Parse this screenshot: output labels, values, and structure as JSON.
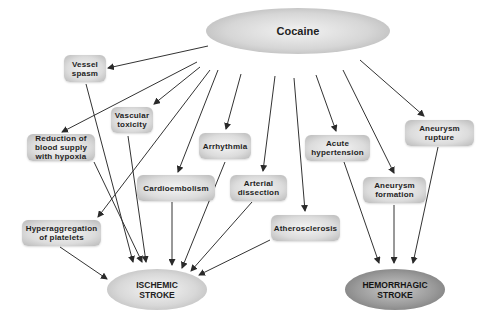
{
  "diagram": {
    "source_node": {
      "id": "cocaine",
      "label": "Cocaine"
    },
    "mechanisms": [
      {
        "id": "vessel-spasm",
        "label": "Vessel\nspasm"
      },
      {
        "id": "vascular-toxicity",
        "label": "Vascular\ntoxicity"
      },
      {
        "id": "reduction-blood-supply",
        "label": "Reduction of\nblood supply\nwith hypoxia"
      },
      {
        "id": "arrhythmia",
        "label": "Arrhythmia"
      },
      {
        "id": "cardioembolism",
        "label": "Cardioembolism"
      },
      {
        "id": "arterial-dissection",
        "label": "Arterial\ndissection"
      },
      {
        "id": "atherosclerosis",
        "label": "Atherosclerosis"
      },
      {
        "id": "hyperaggregation",
        "label": "Hyperaggregation\nof platelets"
      },
      {
        "id": "acute-hypertension",
        "label": "Acute\nhypertension"
      },
      {
        "id": "aneurysm-formation",
        "label": "Aneurysm\nformation"
      },
      {
        "id": "aneurysm-rupture",
        "label": "Aneurysm\nrupture"
      }
    ],
    "outcomes": [
      {
        "id": "ischemic-stroke",
        "label": "ISCHEMIC\nSTROKE"
      },
      {
        "id": "hemorrhagic-stroke",
        "label": "HEMORRHAGIC\nSTROKE"
      }
    ],
    "edges": [
      [
        "cocaine",
        "vessel-spasm"
      ],
      [
        "cocaine",
        "vascular-toxicity"
      ],
      [
        "cocaine",
        "reduction-blood-supply"
      ],
      [
        "cocaine",
        "hyperaggregation"
      ],
      [
        "cocaine",
        "cardioembolism"
      ],
      [
        "cocaine",
        "arrhythmia"
      ],
      [
        "cocaine",
        "arterial-dissection"
      ],
      [
        "cocaine",
        "atherosclerosis"
      ],
      [
        "cocaine",
        "acute-hypertension"
      ],
      [
        "cocaine",
        "aneurysm-formation"
      ],
      [
        "cocaine",
        "aneurysm-rupture"
      ],
      [
        "vessel-spasm",
        "ischemic-stroke"
      ],
      [
        "vascular-toxicity",
        "ischemic-stroke"
      ],
      [
        "reduction-blood-supply",
        "ischemic-stroke"
      ],
      [
        "hyperaggregation",
        "ischemic-stroke"
      ],
      [
        "cardioembolism",
        "ischemic-stroke"
      ],
      [
        "arrhythmia",
        "ischemic-stroke"
      ],
      [
        "arterial-dissection",
        "ischemic-stroke"
      ],
      [
        "atherosclerosis",
        "ischemic-stroke"
      ],
      [
        "acute-hypertension",
        "hemorrhagic-stroke"
      ],
      [
        "aneurysm-formation",
        "hemorrhagic-stroke"
      ],
      [
        "aneurysm-rupture",
        "hemorrhagic-stroke"
      ]
    ]
  }
}
